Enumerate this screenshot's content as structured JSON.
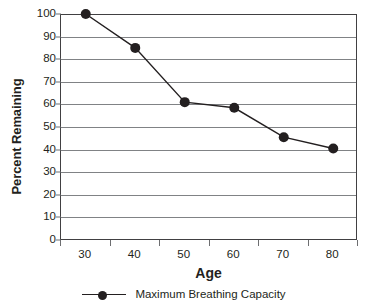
{
  "chart_data": {
    "type": "line",
    "title": "",
    "xlabel": "Age",
    "ylabel": "Percent Remaining",
    "x": [
      30,
      40,
      50,
      60,
      70,
      80
    ],
    "xticklabels": [
      "30",
      "40",
      "50",
      "60",
      "70",
      "80"
    ],
    "yticklabels": [
      "100",
      "90",
      "80",
      "70",
      "60",
      "50",
      "40",
      "30",
      "20",
      "10",
      "0"
    ],
    "yticks": [
      100,
      90,
      80,
      70,
      60,
      50,
      40,
      30,
      20,
      10,
      0
    ],
    "ylim": [
      0,
      100
    ],
    "grid": "horizontal",
    "legend_position": "bottom-center",
    "series": [
      {
        "name": "Maximum Breathing Capacity",
        "values": [
          100,
          85,
          61,
          58.5,
          45.5,
          40.5
        ],
        "marker": "filled-circle",
        "color": "#231f20"
      }
    ],
    "colors": {
      "line": "#231f20",
      "marker": "#231f20",
      "gridline": "#808285",
      "axis": "#414042",
      "text": "#231f20",
      "background": "#ffffff"
    }
  },
  "legend": {
    "entries": [
      {
        "label": "Maximum Breathing Capacity",
        "marker_icon": "line-with-dot-marker"
      }
    ]
  }
}
